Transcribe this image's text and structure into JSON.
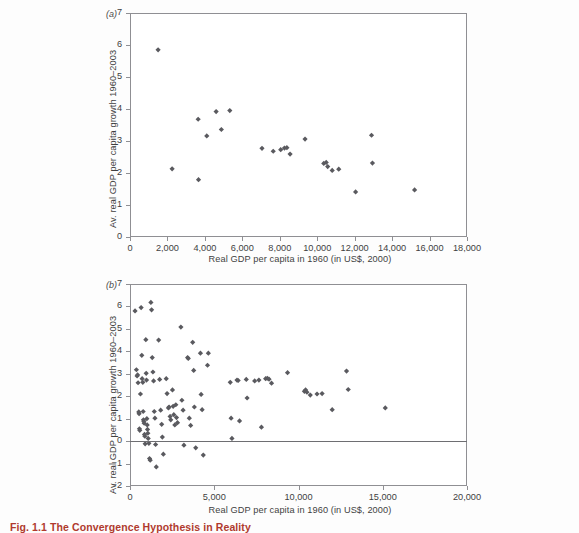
{
  "figure": {
    "caption": "Fig. 1.1 The Convergence Hypothesis in Reality",
    "background_color": "#fdfdfd",
    "marker_color": "#5a5a5f",
    "axis_color": "#8f8f93"
  },
  "chart_data": [
    {
      "type": "scatter",
      "panel_label": "(a)",
      "title": "",
      "xlabel": "Real GDP per capita in 1960 (in US$, 2000)",
      "ylabel": "Av. real GDP per capita growth 1960–2003",
      "xlim": [
        0,
        18000
      ],
      "ylim": [
        0,
        7
      ],
      "xticks": [
        0,
        2000,
        4000,
        6000,
        8000,
        10000,
        12000,
        14000,
        16000,
        18000
      ],
      "xticklabels": [
        "0",
        "2,000",
        "4,000",
        "6,000",
        "8,000",
        "10,000",
        "12,000",
        "14,000",
        "16,000",
        "18,000"
      ],
      "yticks": [
        0,
        1,
        2,
        3,
        4,
        5,
        6,
        7
      ],
      "yticklabels": [
        "0",
        "1",
        "2",
        "3",
        "4",
        "5",
        "6",
        "7"
      ],
      "grid": false,
      "legend": null,
      "points": [
        [
          1500,
          5.85
        ],
        [
          2250,
          2.13
        ],
        [
          3640,
          3.68
        ],
        [
          3660,
          1.79
        ],
        [
          4100,
          3.16
        ],
        [
          4600,
          3.92
        ],
        [
          4880,
          3.36
        ],
        [
          5330,
          3.95
        ],
        [
          7050,
          2.77
        ],
        [
          7650,
          2.68
        ],
        [
          8050,
          2.73
        ],
        [
          8250,
          2.78
        ],
        [
          8380,
          2.79
        ],
        [
          8550,
          2.59
        ],
        [
          9350,
          3.06
        ],
        [
          10350,
          2.3
        ],
        [
          10480,
          2.33
        ],
        [
          10560,
          2.2
        ],
        [
          10800,
          2.08
        ],
        [
          11150,
          2.12
        ],
        [
          12050,
          1.41
        ],
        [
          12900,
          3.18
        ],
        [
          12950,
          2.31
        ],
        [
          15200,
          1.47
        ]
      ]
    },
    {
      "type": "scatter",
      "panel_label": "(b)",
      "title": "",
      "xlabel": "Real GDP per capita in 1960 (in US$, 2000)",
      "ylabel": "Av. real GDP per capita growth 1960–2003",
      "xlim": [
        0,
        20000
      ],
      "ylim": [
        -2,
        7
      ],
      "xticks": [
        0,
        5000,
        10000,
        15000,
        20000
      ],
      "xticklabels": [
        "0",
        "5,000",
        "10,000",
        "15,000",
        "20,000"
      ],
      "yticks": [
        -2,
        -1,
        0,
        1,
        2,
        3,
        4,
        5,
        6,
        7
      ],
      "yticklabels": [
        "−2",
        "−1",
        "0",
        "1",
        "2",
        "3",
        "4",
        "5",
        "6",
        "7"
      ],
      "grid": false,
      "zeroline": 0,
      "legend": null,
      "points": [
        [
          300,
          5.8
        ],
        [
          380,
          3.18
        ],
        [
          420,
          2.9
        ],
        [
          450,
          2.95
        ],
        [
          480,
          2.6
        ],
        [
          520,
          1.3
        ],
        [
          540,
          1.22
        ],
        [
          560,
          0.55
        ],
        [
          580,
          0.48
        ],
        [
          620,
          2.1
        ],
        [
          660,
          5.95
        ],
        [
          700,
          3.82
        ],
        [
          720,
          2.78
        ],
        [
          760,
          2.62
        ],
        [
          780,
          1.32
        ],
        [
          800,
          0.95
        ],
        [
          820,
          0.88
        ],
        [
          840,
          0.8
        ],
        [
          860,
          0.3
        ],
        [
          880,
          0.22
        ],
        [
          900,
          -0.12
        ],
        [
          940,
          4.52
        ],
        [
          960,
          3.02
        ],
        [
          980,
          2.72
        ],
        [
          1000,
          1.0
        ],
        [
          1020,
          0.72
        ],
        [
          1040,
          0.52
        ],
        [
          1060,
          0.35
        ],
        [
          1080,
          0.12
        ],
        [
          1120,
          -0.1
        ],
        [
          1160,
          -0.78
        ],
        [
          1200,
          -0.85
        ],
        [
          1240,
          6.18
        ],
        [
          1280,
          5.85
        ],
        [
          1320,
          3.72
        ],
        [
          1360,
          3.08
        ],
        [
          1400,
          2.68
        ],
        [
          1440,
          1.32
        ],
        [
          1480,
          1.02
        ],
        [
          1520,
          -0.15
        ],
        [
          1560,
          -1.15
        ],
        [
          1700,
          4.5
        ],
        [
          1760,
          2.75
        ],
        [
          1820,
          1.38
        ],
        [
          1880,
          0.75
        ],
        [
          1920,
          0.18
        ],
        [
          1980,
          -0.58
        ],
        [
          2150,
          2.78
        ],
        [
          2200,
          2.12
        ],
        [
          2280,
          1.48
        ],
        [
          2320,
          1.52
        ],
        [
          2380,
          1.1
        ],
        [
          2420,
          0.95
        ],
        [
          2520,
          2.28
        ],
        [
          2560,
          1.55
        ],
        [
          2600,
          1.18
        ],
        [
          2660,
          0.72
        ],
        [
          2720,
          1.62
        ],
        [
          2760,
          1.05
        ],
        [
          2820,
          0.82
        ],
        [
          3020,
          5.08
        ],
        [
          3080,
          1.82
        ],
        [
          3150,
          1.38
        ],
        [
          3200,
          -0.18
        ],
        [
          3420,
          3.72
        ],
        [
          3460,
          3.68
        ],
        [
          3520,
          1.02
        ],
        [
          3600,
          0.7
        ],
        [
          3720,
          4.4
        ],
        [
          3780,
          3.15
        ],
        [
          3820,
          1.52
        ],
        [
          3900,
          -0.3
        ],
        [
          4180,
          3.92
        ],
        [
          4220,
          2.08
        ],
        [
          4280,
          1.4
        ],
        [
          4350,
          -0.62
        ],
        [
          4600,
          3.38
        ],
        [
          4650,
          3.92
        ],
        [
          5950,
          2.62
        ],
        [
          6000,
          1.02
        ],
        [
          6050,
          0.12
        ],
        [
          6350,
          2.72
        ],
        [
          6420,
          2.7
        ],
        [
          6500,
          0.9
        ],
        [
          6900,
          2.75
        ],
        [
          6950,
          1.92
        ],
        [
          7400,
          2.68
        ],
        [
          7650,
          2.72
        ],
        [
          7800,
          0.62
        ],
        [
          8050,
          2.78
        ],
        [
          8150,
          2.8
        ],
        [
          8250,
          2.76
        ],
        [
          8400,
          2.58
        ],
        [
          9350,
          3.05
        ],
        [
          10350,
          2.22
        ],
        [
          10420,
          2.28
        ],
        [
          10500,
          2.18
        ],
        [
          10700,
          2.05
        ],
        [
          11100,
          2.1
        ],
        [
          11400,
          2.12
        ],
        [
          12000,
          1.4
        ],
        [
          12850,
          3.12
        ],
        [
          12950,
          2.3
        ],
        [
          15150,
          1.48
        ]
      ]
    }
  ]
}
